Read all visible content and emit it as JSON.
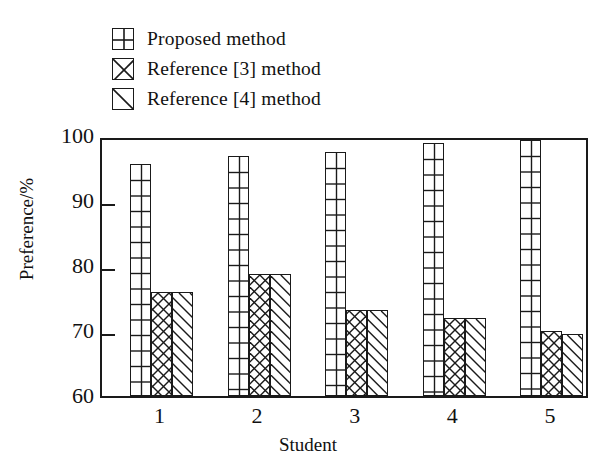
{
  "chart_data": {
    "type": "bar",
    "title": "",
    "xlabel": "Student",
    "ylabel": "Preference/%",
    "categories": [
      "1",
      "2",
      "3",
      "4",
      "5"
    ],
    "ylim": [
      60,
      100
    ],
    "yticks": [
      60,
      70,
      80,
      90,
      100
    ],
    "ytick_labels": [
      "60",
      "70",
      "80",
      "90",
      "100"
    ],
    "grid": false,
    "legend_position": "above-plot-left",
    "series": [
      {
        "name": "Proposed method",
        "pattern": "grid-crosshatch",
        "values": [
          95.7,
          97.0,
          97.5,
          99.0,
          99.4
        ]
      },
      {
        "name": "Reference [3] method",
        "pattern": "diagonal-crosshatch",
        "values": [
          76.0,
          78.8,
          73.2,
          72.0,
          70.0
        ]
      },
      {
        "name": "Reference [4] method",
        "pattern": "diagonal-single",
        "values": [
          76.0,
          78.8,
          73.2,
          72.0,
          69.5
        ]
      }
    ]
  },
  "legend": {
    "items": [
      {
        "label": "Proposed method",
        "swatch": "grid-crosshatch-swatch"
      },
      {
        "label": "Reference [3] method",
        "swatch": "diagonal-crosshatch-swatch"
      },
      {
        "label": "Reference [4] method",
        "swatch": "diagonal-single-swatch"
      }
    ]
  },
  "axes": {
    "y_title": "Preference/%",
    "x_title": "Student"
  },
  "colors": {
    "ink": "#1a1a1a",
    "background": "#ffffff"
  }
}
